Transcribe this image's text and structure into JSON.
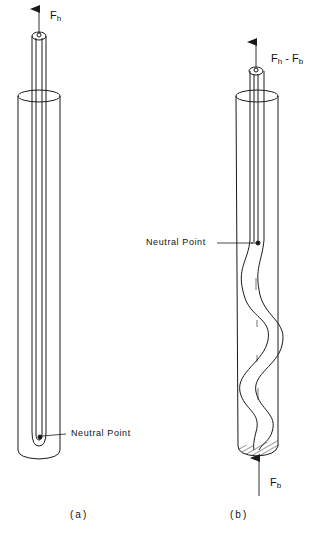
{
  "figure": {
    "type": "two-panel engineering diagram: tubing inside casing showing neutral point",
    "panels": [
      {
        "id": "a",
        "caption": "(a)",
        "force_top": {
          "symbol": "F",
          "subscript": "h"
        },
        "neutral_point_label": "Neutral Point",
        "tubing_state": "straight"
      },
      {
        "id": "b",
        "caption": "(b)",
        "force_top": {
          "symbol": "F",
          "subscript": "h",
          "minus": " - F",
          "minus_subscript": "b"
        },
        "force_bottom": {
          "symbol": "F",
          "subscript": "b"
        },
        "neutral_point_label": "Neutral Point",
        "tubing_state": "helically buckled below neutral point"
      }
    ]
  },
  "colors": {
    "line": "#1a1a1a",
    "background": "#ffffff"
  }
}
